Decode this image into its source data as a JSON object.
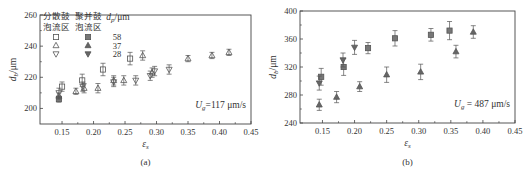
{
  "chart_data": [
    {
      "type": "scatter",
      "panel": "(a)",
      "caption": "(a)",
      "xlabel": "ε_s",
      "ylabel": "d_b/μm",
      "xlim": [
        0.115,
        0.45
      ],
      "ylim": [
        190,
        260
      ],
      "xticks": [
        0.15,
        0.2,
        0.25,
        0.3,
        0.35,
        0.4,
        0.45
      ],
      "xtick_labels": [
        "0.15",
        "0.20",
        "0.25",
        "0.30",
        "0.35",
        "0.40",
        "0.45"
      ],
      "yticks": [
        200,
        220,
        240,
        260
      ],
      "ytick_labels": [
        "200",
        "220",
        "240",
        "260"
      ],
      "annotation": "U_g=117 μm/s",
      "legend": {
        "placement": "top-left",
        "col_headers": [
          "分散鼓泡流区",
          "聚并鼓泡流区",
          "d_p/μm"
        ],
        "rows": [
          {
            "dp": "58",
            "marker": "square"
          },
          {
            "dp": "37",
            "marker": "triangle-up"
          },
          {
            "dp": "28",
            "marker": "triangle-down"
          }
        ]
      },
      "series": [
        {
          "name": "58 μm",
          "marker": "square",
          "points": [
            [
              0.145,
              206,
              2
            ],
            [
              0.15,
              214,
              3
            ],
            [
              0.182,
              218,
              4
            ],
            [
              0.215,
              225,
              4
            ],
            [
              0.258,
              232,
              4
            ]
          ]
        },
        {
          "name": "37 μm",
          "marker": "triangle-up",
          "points": [
            [
              0.145,
              208,
              2
            ],
            [
              0.172,
              211,
              2
            ],
            [
              0.185,
              213,
              3
            ],
            [
              0.207,
              213,
              3
            ],
            [
              0.232,
              218,
              3
            ],
            [
              0.248,
              218,
              3
            ],
            [
              0.278,
              234,
              3
            ],
            [
              0.293,
              223,
              3
            ],
            [
              0.35,
              232,
              2
            ],
            [
              0.388,
              234,
              2
            ],
            [
              0.415,
              236,
              2
            ]
          ]
        },
        {
          "name": "28 μm",
          "marker": "triangle-down",
          "points": [
            [
              0.145,
              210,
              3
            ],
            [
              0.183,
              214,
              3
            ],
            [
              0.232,
              217,
              3
            ],
            [
              0.267,
              218,
              3
            ],
            [
              0.29,
              221,
              3
            ],
            [
              0.297,
              224,
              3
            ],
            [
              0.32,
              225,
              3
            ]
          ]
        }
      ]
    },
    {
      "type": "scatter",
      "panel": "(b)",
      "caption": "(b)",
      "xlabel": "ε_s",
      "ylabel": "d_b/μm",
      "xlim": [
        0.115,
        0.45
      ],
      "ylim": [
        240,
        400
      ],
      "xticks": [
        0.15,
        0.2,
        0.25,
        0.3,
        0.35,
        0.4,
        0.45
      ],
      "xtick_labels": [
        "0.15",
        "0.20",
        "0.25",
        "0.30",
        "0.35",
        "0.40",
        "0.45"
      ],
      "yticks": [
        240,
        280,
        320,
        360,
        400
      ],
      "ytick_labels": [
        "240",
        "280",
        "320",
        "360",
        "400"
      ],
      "annotation": "U_g = 487 μm/s",
      "series": [
        {
          "name": "58 μm",
          "marker": "square",
          "points": [
            [
              0.148,
              306,
              12
            ],
            [
              0.183,
              320,
              12
            ],
            [
              0.221,
              347,
              8
            ],
            [
              0.263,
              361,
              11
            ],
            [
              0.319,
              366,
              9
            ],
            [
              0.348,
              372,
              13
            ]
          ]
        },
        {
          "name": "37 μm",
          "marker": "triangle-up",
          "points": [
            [
              0.145,
              266,
              8
            ],
            [
              0.172,
              277,
              8
            ],
            [
              0.208,
              292,
              7
            ],
            [
              0.25,
              309,
              11
            ],
            [
              0.303,
              313,
              11
            ],
            [
              0.358,
              342,
              9
            ],
            [
              0.385,
              370,
              9
            ]
          ]
        },
        {
          "name": "28 μm",
          "marker": "triangle-down",
          "points": [
            [
              0.145,
              297,
              10
            ],
            [
              0.182,
              330,
              10
            ],
            [
              0.2,
              348,
              10
            ]
          ]
        }
      ]
    }
  ]
}
